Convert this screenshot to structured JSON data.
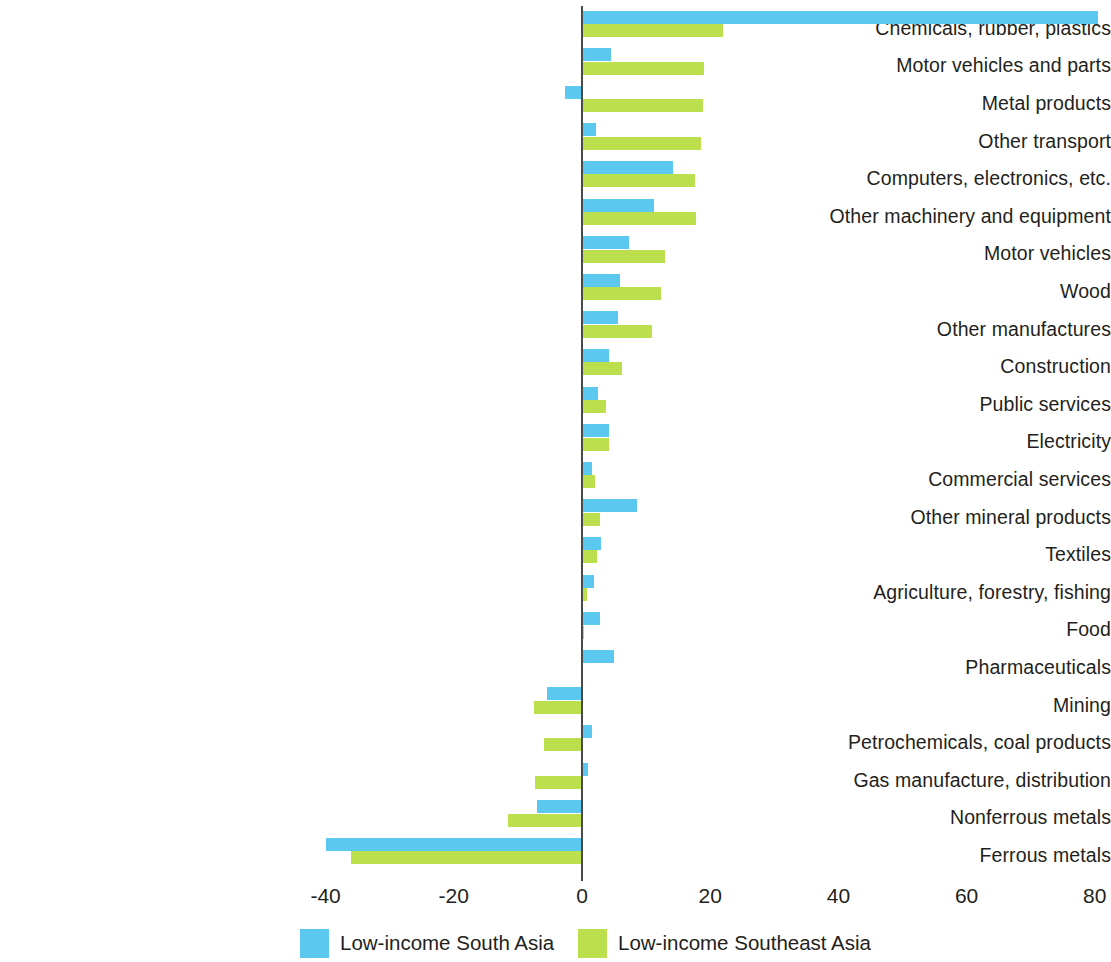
{
  "chart_data": {
    "type": "bar",
    "orientation": "horizontal",
    "title": "",
    "subtitle": "",
    "xlabel": "",
    "ylabel": "",
    "xlim": [
      -40,
      80
    ],
    "xticks": [
      "-40",
      "-20",
      "0",
      "20",
      "40",
      "60",
      "80"
    ],
    "xtick_values": [
      -40,
      -20,
      0,
      20,
      40,
      60,
      80
    ],
    "grid": false,
    "legend_position": "bottom",
    "zero_line": true,
    "categories": [
      "Chemicals, rubber, plastics",
      "Motor vehicles and parts",
      "Metal products",
      "Other transport",
      "Computers, electronics, etc.",
      "Other machinery and equipment",
      "Motor vehicles",
      "Wood",
      "Other manufactures",
      "Construction",
      "Public services",
      "Electricity",
      "Commercial services",
      "Other mineral products",
      "Textiles",
      "Agriculture, forestry, fishing",
      "Food",
      "Pharmaceuticals",
      "Mining",
      "Petrochemicals, coal products",
      "Gas manufacture, distribution",
      "Nonferrous metals",
      "Ferrous metals"
    ],
    "series": [
      {
        "name": "Low-income South Asia",
        "color": "#5bc8ef",
        "values": [
          80.5,
          4.6,
          -2.6,
          2.2,
          14.2,
          11.3,
          7.3,
          6.0,
          5.6,
          4.2,
          2.5,
          4.2,
          1.6,
          8.6,
          3.0,
          1.9,
          2.8,
          5.0,
          -5.5,
          1.5,
          1.0,
          -7.0,
          -40.0
        ]
      },
      {
        "name": "Low-income Southeast Asia",
        "color": "#bce04d",
        "values": [
          22.0,
          19.0,
          18.8,
          18.5,
          17.6,
          17.8,
          13.0,
          12.3,
          10.9,
          6.2,
          3.7,
          4.2,
          2.1,
          2.8,
          2.4,
          0.8,
          0.3,
          0.2,
          -7.5,
          -6.0,
          -7.3,
          -11.5,
          -36.0
        ]
      }
    ]
  },
  "legend": {
    "items": [
      {
        "label": "Low-income South Asia",
        "swatch": "blue"
      },
      {
        "label": "Low-income Southeast Asia",
        "swatch": "green"
      }
    ]
  }
}
